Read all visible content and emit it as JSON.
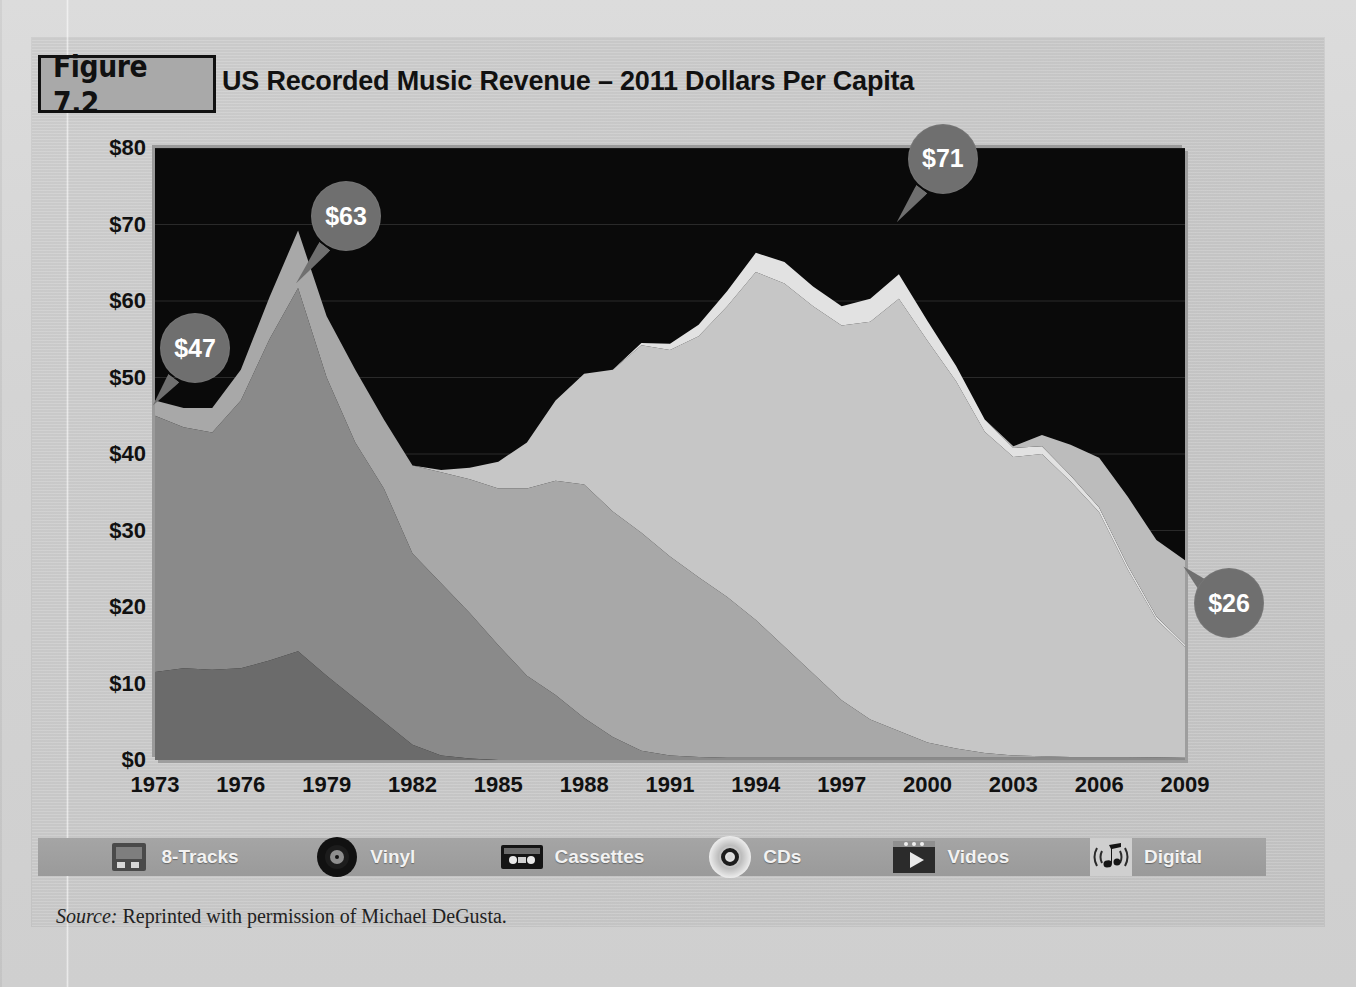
{
  "figure": {
    "badge": "Figure 7.2",
    "title": "US Recorded Music Revenue – 2011 Dollars Per Capita",
    "source_label": "Source:",
    "source_text": "Reprinted with permission of Michael DeGusta."
  },
  "colors": {
    "page_background": "#d2d2d2",
    "panel_background": "#c9c9c9",
    "plot_background": "#0a0a0a",
    "badge_fill": "#a9a9a9",
    "callout_fill": "#6f6f6f",
    "callout_text": "#ffffff",
    "legend_bar": "#9f9f9f",
    "eight_tracks": "#6b6b6b",
    "vinyl": "#8a8a8a",
    "cassettes": "#a8a8a8",
    "cds": "#c6c6c6",
    "videos": "#e2e2e2",
    "digital": "#bcbcbc"
  },
  "legend": {
    "items": [
      {
        "label": "8-Tracks",
        "icon": "eight-track-cartridge-icon",
        "color": "#6b6b6b"
      },
      {
        "label": "Vinyl",
        "icon": "vinyl-record-icon",
        "color": "#8a8a8a"
      },
      {
        "label": "Cassettes",
        "icon": "cassette-tape-icon",
        "color": "#a8a8a8"
      },
      {
        "label": "CDs",
        "icon": "compact-disc-icon",
        "color": "#c6c6c6"
      },
      {
        "label": "Videos",
        "icon": "video-play-icon",
        "color": "#e2e2e2"
      },
      {
        "label": "Digital",
        "icon": "digital-music-note-icon",
        "color": "#bcbcbc"
      }
    ]
  },
  "callouts": [
    {
      "name": "callout-1973",
      "label": "$47",
      "year": 1973,
      "value": 47
    },
    {
      "name": "callout-1978",
      "label": "$63",
      "year": 1978,
      "value": 63
    },
    {
      "name": "callout-1999",
      "label": "$71",
      "year": 1999,
      "value": 71
    },
    {
      "name": "callout-2009",
      "label": "$26",
      "year": 2009,
      "value": 26
    }
  ],
  "chart_data": {
    "type": "area",
    "stacked": true,
    "title": "US Recorded Music Revenue – 2011 Dollars Per Capita",
    "xlabel": "",
    "ylabel": "2011 Dollars Per Capita",
    "xlim": [
      1973,
      2009
    ],
    "ylim": [
      0,
      80
    ],
    "ytick_labels": [
      "$0",
      "$10",
      "$20",
      "$30",
      "$40",
      "$50",
      "$60",
      "$70",
      "$80"
    ],
    "ytick_values": [
      0,
      10,
      20,
      30,
      40,
      50,
      60,
      70,
      80
    ],
    "xtick_labels": [
      "1973",
      "1976",
      "1979",
      "1982",
      "1985",
      "1988",
      "1991",
      "1994",
      "1997",
      "2000",
      "2003",
      "2006",
      "2009"
    ],
    "xtick_values": [
      1973,
      1976,
      1979,
      1982,
      1985,
      1988,
      1991,
      1994,
      1997,
      2000,
      2003,
      2006,
      2009
    ],
    "grid": true,
    "legend_position": "bottom",
    "x": [
      1973,
      1974,
      1975,
      1976,
      1977,
      1978,
      1979,
      1980,
      1981,
      1982,
      1983,
      1984,
      1985,
      1986,
      1987,
      1988,
      1989,
      1990,
      1991,
      1992,
      1993,
      1994,
      1995,
      1996,
      1997,
      1998,
      1999,
      2000,
      2001,
      2002,
      2003,
      2004,
      2005,
      2006,
      2007,
      2008,
      2009
    ],
    "series": [
      {
        "name": "8-Tracks",
        "color": "#6b6b6b",
        "values": [
          11.5,
          12.0,
          11.8,
          12.0,
          13.0,
          14.2,
          11.0,
          8.0,
          5.0,
          2.0,
          0.6,
          0.2,
          0,
          0,
          0,
          0,
          0,
          0,
          0,
          0,
          0,
          0,
          0,
          0,
          0,
          0,
          0,
          0,
          0,
          0,
          0,
          0,
          0,
          0,
          0,
          0,
          0
        ]
      },
      {
        "name": "Vinyl",
        "color": "#8a8a8a",
        "values": [
          33.5,
          31.5,
          31.0,
          35.0,
          42.0,
          47.5,
          39.0,
          33.5,
          30.5,
          25.0,
          22.5,
          19.0,
          15.0,
          11.0,
          8.5,
          5.5,
          3.0,
          1.2,
          0.6,
          0.4,
          0.3,
          0.3,
          0.3,
          0.3,
          0.3,
          0.3,
          0.3,
          0.3,
          0.3,
          0.3,
          0.3,
          0.3,
          0.3,
          0.3,
          0.3,
          0.3,
          0.3
        ]
      },
      {
        "name": "Cassettes",
        "color": "#a8a8a8",
        "values": [
          2.0,
          2.5,
          3.2,
          4.0,
          5.5,
          7.5,
          8.0,
          9.5,
          9.0,
          11.5,
          14.5,
          17.5,
          20.5,
          24.5,
          28.0,
          30.5,
          29.5,
          28.5,
          26.0,
          23.5,
          21.0,
          18.0,
          14.5,
          11.0,
          7.5,
          5.0,
          3.5,
          2.0,
          1.2,
          0.6,
          0.3,
          0.2,
          0.1,
          0.1,
          0.1,
          0.05,
          0.0
        ]
      },
      {
        "name": "CDs",
        "color": "#c6c6c6",
        "values": [
          0,
          0,
          0,
          0,
          0,
          0,
          0,
          0,
          0,
          0,
          0.3,
          1.5,
          3.5,
          6.0,
          10.5,
          14.5,
          18.5,
          24.5,
          27.0,
          31.5,
          38.0,
          45.5,
          47.5,
          48.0,
          49.0,
          52.0,
          56.5,
          52.5,
          48.0,
          42.0,
          39.0,
          39.5,
          36.0,
          32.0,
          24.5,
          18.0,
          14.5
        ]
      },
      {
        "name": "Videos",
        "color": "#e2e2e2",
        "values": [
          0,
          0,
          0,
          0,
          0,
          0,
          0,
          0,
          0,
          0,
          0,
          0,
          0,
          0,
          0,
          0,
          0,
          0.3,
          0.8,
          1.5,
          2.0,
          2.5,
          2.8,
          2.6,
          2.5,
          3.0,
          3.2,
          2.6,
          2.0,
          1.6,
          1.2,
          1.0,
          0.8,
          0.6,
          0.5,
          0.4,
          0.3
        ]
      },
      {
        "name": "Digital",
        "color": "#bcbcbc",
        "values": [
          0,
          0,
          0,
          0,
          0,
          0,
          0,
          0,
          0,
          0,
          0,
          0,
          0,
          0,
          0,
          0,
          0,
          0,
          0,
          0,
          0,
          0,
          0,
          0,
          0,
          0,
          0,
          0,
          0,
          0,
          0.2,
          1.5,
          4.0,
          6.5,
          9.0,
          10.0,
          11.0
        ]
      }
    ],
    "totals": [
      47.0,
      46.0,
      46.0,
      51.0,
      60.5,
      69.2,
      58.0,
      51.0,
      44.5,
      38.5,
      37.9,
      38.2,
      39.0,
      41.5,
      47.0,
      50.5,
      51.0,
      54.5,
      54.4,
      56.9,
      61.3,
      66.3,
      65.1,
      61.9,
      59.3,
      60.3,
      63.5,
      57.4,
      51.5,
      44.5,
      41.0,
      42.5,
      41.2,
      39.5,
      34.4,
      28.75,
      26.1
    ],
    "annotations": [
      {
        "text": "$47",
        "year": 1973,
        "value": 47
      },
      {
        "text": "$63",
        "year": 1978,
        "value": 63
      },
      {
        "text": "$71",
        "year": 1999,
        "value": 71
      },
      {
        "text": "$26",
        "year": 2009,
        "value": 26
      }
    ]
  }
}
